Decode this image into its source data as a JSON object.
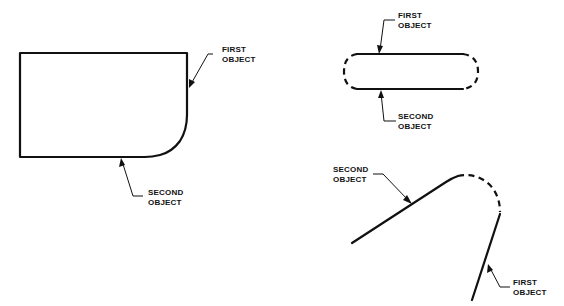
{
  "figures": [
    {
      "id": "rect-with-fillet",
      "labels": {
        "first": [
          "FIRST",
          "OBJECT"
        ],
        "second": [
          "SECOND",
          "OBJECT"
        ]
      }
    },
    {
      "id": "slot-with-rounded-ends",
      "labels": {
        "first": [
          "FIRST",
          "OBJECT"
        ],
        "second": [
          "SECOND",
          "OBJECT"
        ]
      }
    },
    {
      "id": "angled-lines-with-arc",
      "labels": {
        "first": [
          "FIRST",
          "OBJECT"
        ],
        "second": [
          "SECOND",
          "OBJECT"
        ]
      }
    }
  ],
  "colors": {
    "line": "#111111",
    "background": "#ffffff"
  }
}
